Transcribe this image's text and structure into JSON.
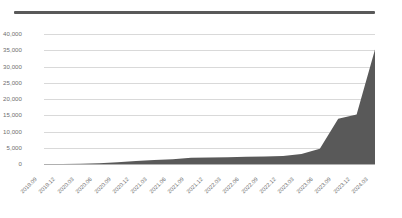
{
  "top_rule": {
    "color": "#595959"
  },
  "chart_data": {
    "type": "area",
    "title": "",
    "subtitle": "",
    "xlabel": "",
    "ylabel": "",
    "grid": true,
    "legend": false,
    "legend_position": "none",
    "series_color": "#595959",
    "gridline_color": "#d9d9d9",
    "axis_color": "#b0b0b0",
    "tick_label_color": "#6e6e6e",
    "ylim": [
      0,
      40000
    ],
    "ytick_labels": [
      "40,000",
      "35,000",
      "30,000",
      "25,000",
      "20,000",
      "15,000",
      "10,000",
      "5,000",
      "0"
    ],
    "ytick_values": [
      40000,
      35000,
      30000,
      25000,
      20000,
      15000,
      10000,
      5000,
      0
    ],
    "categories": [
      "2019.09",
      "2019.12",
      "2020.03",
      "2020.06",
      "2020.09",
      "2020.12",
      "2021.03",
      "2021.06",
      "2021.09",
      "2021.12",
      "2022.03",
      "2022.06",
      "2022.09",
      "2022.12",
      "2023.03",
      "2023.06",
      "2023.09",
      "2023.12",
      "2024.03"
    ],
    "values": [
      0,
      30,
      90,
      250,
      520,
      900,
      1250,
      1450,
      1900,
      2000,
      2100,
      2200,
      2300,
      2450,
      3050,
      4700,
      13900,
      15200,
      35200
    ],
    "annotations": []
  }
}
